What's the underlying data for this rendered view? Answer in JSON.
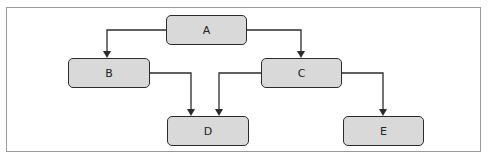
{
  "diagram": {
    "type": "tree-flowchart",
    "colors": {
      "node_fill": "#d9d9d9",
      "node_border": "#2b2b2b",
      "edge": "#2b2b2b",
      "frame": "#9a9a9a"
    },
    "nodes": [
      {
        "id": "A",
        "label": "A"
      },
      {
        "id": "B",
        "label": "B"
      },
      {
        "id": "C",
        "label": "C"
      },
      {
        "id": "D",
        "label": "D"
      },
      {
        "id": "E",
        "label": "E"
      }
    ],
    "edges": [
      {
        "from": "A",
        "to": "B"
      },
      {
        "from": "A",
        "to": "C"
      },
      {
        "from": "B",
        "to": "D"
      },
      {
        "from": "C",
        "to": "D"
      },
      {
        "from": "C",
        "to": "E"
      }
    ]
  }
}
